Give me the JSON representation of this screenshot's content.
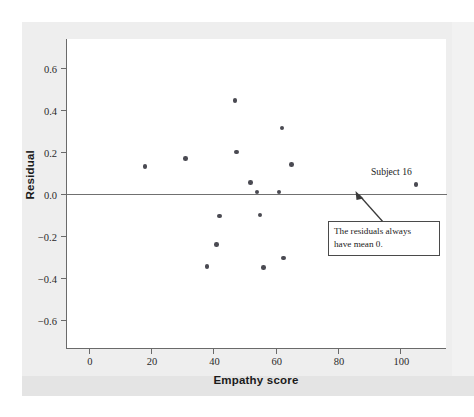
{
  "chart_data": {
    "type": "scatter",
    "title": "",
    "xlabel": "Empathy score",
    "ylabel": "Residual",
    "xlim": [
      -7,
      115
    ],
    "ylim": [
      -0.74,
      0.74
    ],
    "xticks": [
      0,
      20,
      40,
      60,
      80,
      100
    ],
    "xticklabels": [
      "0",
      "20",
      "40",
      "60",
      "80",
      "100"
    ],
    "yticks": [
      0.6,
      0.4,
      0.2,
      0.0,
      -0.2,
      -0.4,
      -0.6
    ],
    "yticklabels": [
      "0.6",
      "0.4",
      "0.2",
      "0.0",
      "-0.2",
      "-0.4",
      "-0.6"
    ],
    "grid": false,
    "legend": null,
    "reference_lines": [
      {
        "name": "zero-residual-line",
        "axis": "y",
        "value": 0.0
      }
    ],
    "points": [
      {
        "x": 18,
        "y": 0.13
      },
      {
        "x": 31,
        "y": 0.17
      },
      {
        "x": 38,
        "y": -0.345
      },
      {
        "x": 41,
        "y": -0.24
      },
      {
        "x": 42,
        "y": -0.105
      },
      {
        "x": 47,
        "y": 0.445
      },
      {
        "x": 47.5,
        "y": 0.2
      },
      {
        "x": 52,
        "y": 0.055
      },
      {
        "x": 54,
        "y": 0.01
      },
      {
        "x": 55,
        "y": -0.1
      },
      {
        "x": 56,
        "y": -0.35
      },
      {
        "x": 61,
        "y": 0.01
      },
      {
        "x": 62,
        "y": 0.315
      },
      {
        "x": 62.5,
        "y": -0.305
      },
      {
        "x": 65,
        "y": 0.14
      },
      {
        "x": 105,
        "y": 0.045
      }
    ],
    "annotations": [
      {
        "name": "subject-16-label",
        "text": "Subject 16",
        "x": 98,
        "y": 0.15
      },
      {
        "name": "mean-zero-callout",
        "line1": "The residuals always",
        "line2": "have mean 0.",
        "points_to": {
          "x": 92,
          "y": 0.0
        }
      }
    ]
  },
  "colors": {
    "point": "#4a4a52",
    "axis": "#6a6a6a",
    "zero_line": "#707070",
    "page_background": "#eeeeee",
    "plot_background": "#ffffff",
    "text": "#1b1b1b"
  }
}
